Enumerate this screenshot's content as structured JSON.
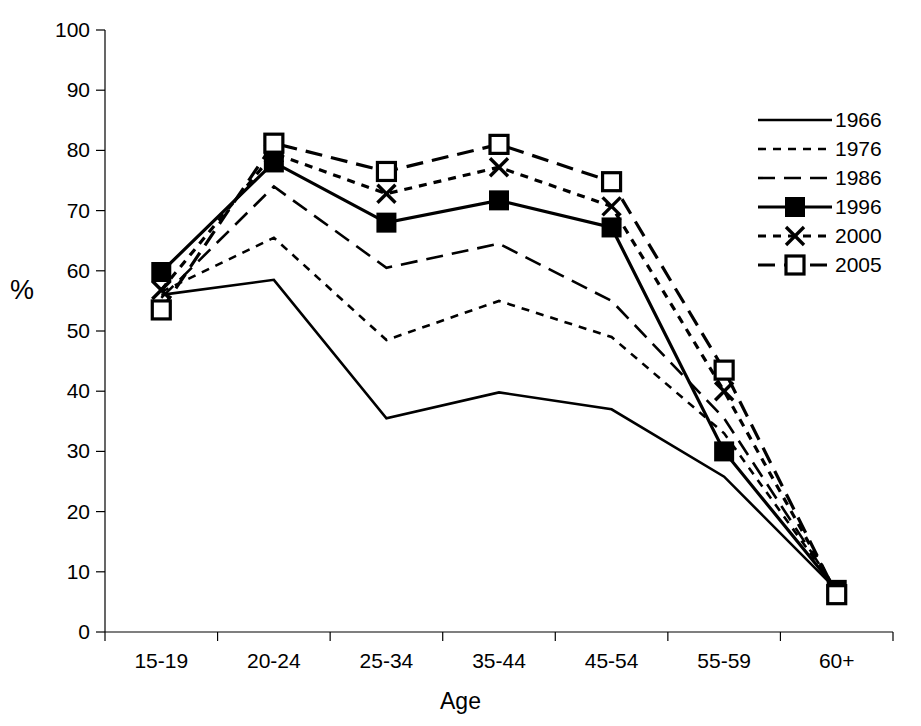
{
  "chart_data": {
    "type": "line",
    "title": "",
    "xlabel": "Age",
    "ylabel": "%",
    "categories": [
      "15-19",
      "20-24",
      "25-34",
      "35-44",
      "45-54",
      "55-59",
      "60+"
    ],
    "ylim": [
      0,
      100
    ],
    "ytick_values": [
      0,
      10,
      20,
      30,
      40,
      50,
      60,
      70,
      80,
      90,
      100
    ],
    "ytick_labels": [
      "0",
      "10",
      "20",
      "30",
      "40",
      "50",
      "60",
      "70",
      "80",
      "90",
      "100"
    ],
    "grid": false,
    "legend_position": "right",
    "series": [
      {
        "name": "1966",
        "style": "solid",
        "marker": "none",
        "color": "#000000",
        "values": [
          56.0,
          58.5,
          35.5,
          39.8,
          37.0,
          25.8,
          7.0
        ]
      },
      {
        "name": "1976",
        "style": "dotted",
        "marker": "none",
        "color": "#000000",
        "values": [
          56.5,
          65.5,
          48.5,
          55.0,
          49.0,
          33.0,
          7.0
        ]
      },
      {
        "name": "1986",
        "style": "dashed",
        "marker": "none",
        "color": "#000000",
        "values": [
          55.5,
          74.0,
          60.5,
          64.5,
          55.0,
          35.5,
          6.8
        ]
      },
      {
        "name": "1996",
        "style": "solid",
        "marker": "filled-square",
        "color": "#000000",
        "values": [
          59.8,
          78.0,
          68.0,
          71.7,
          67.2,
          30.0,
          7.0
        ]
      },
      {
        "name": "2000",
        "style": "dotted",
        "marker": "x",
        "color": "#000000",
        "values": [
          56.8,
          79.5,
          72.8,
          77.2,
          70.7,
          40.0,
          6.5
        ]
      },
      {
        "name": "2005",
        "style": "dashed",
        "marker": "open-square",
        "color": "#000000",
        "values": [
          53.5,
          81.2,
          76.5,
          81.0,
          74.8,
          43.5,
          6.2
        ]
      }
    ]
  },
  "legend": {
    "items": [
      "1966",
      "1976",
      "1986",
      "1996",
      "2000",
      "2005"
    ]
  },
  "axes": {
    "x_title": "Age",
    "y_title": "%"
  }
}
